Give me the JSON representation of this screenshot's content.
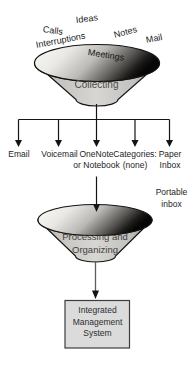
{
  "scatter_labels": [
    {
      "label": "Calls"
    },
    {
      "label": "Ideas"
    },
    {
      "label": "Interruptions"
    },
    {
      "label": "Notes"
    },
    {
      "label": "Mail"
    },
    {
      "label": "Meetings"
    }
  ],
  "funnel1": {
    "label": "Collecting"
  },
  "branches": [
    {
      "lines": [
        "Email"
      ]
    },
    {
      "lines": [
        "Voicemail"
      ]
    },
    {
      "lines": [
        "OneNote",
        "or Notebook"
      ]
    },
    {
      "lines": [
        "Categories:",
        "(none)"
      ]
    },
    {
      "lines": [
        "Paper",
        "Inbox"
      ]
    }
  ],
  "portable_inbox": {
    "lines": [
      "Portable",
      "inbox"
    ]
  },
  "funnel2": {
    "lines": [
      "Processing and",
      "Organizing"
    ]
  },
  "output_box": {
    "lines": [
      "Integrated",
      "Management",
      "System"
    ]
  },
  "colors": {
    "funnel_body_light": "#d7d6d2",
    "funnel_body_edge": "#94938f",
    "rim_light": "#fbfbf9",
    "rim_dark": "#060606",
    "box_fill": "#dbdbdb",
    "outline": "#141414"
  }
}
